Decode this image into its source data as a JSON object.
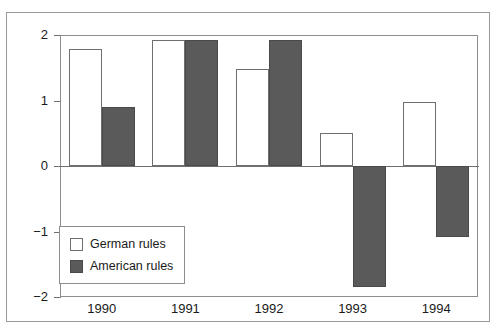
{
  "chart_data": {
    "type": "bar",
    "title": "",
    "subtitle": "",
    "xlabel": "",
    "ylabel": "",
    "categories": [
      "1990",
      "1991",
      "1992",
      "1993",
      "1994"
    ],
    "series": [
      {
        "name": "German rules",
        "values": [
          1.79,
          1.93,
          1.48,
          0.51,
          0.97
        ],
        "color": "#ffffff",
        "edge_color": "#6f6f6f"
      },
      {
        "name": "American rules",
        "values": [
          0.9,
          1.93,
          1.92,
          -1.85,
          -1.08
        ],
        "color": "#5a5a5a",
        "edge_color": "#4a4a4a"
      }
    ],
    "ylim": [
      -2,
      2
    ],
    "yticks": [
      2,
      1,
      0,
      -1,
      -2
    ],
    "ytick_labels": [
      "2",
      "1",
      "0",
      "−1",
      "−2"
    ],
    "grid": false,
    "zero_line": true,
    "legend_position": "lower-left-inside"
  },
  "axes": {
    "y_ticks": [
      {
        "label": "2",
        "value": 2
      },
      {
        "label": "1",
        "value": 1
      },
      {
        "label": "0",
        "value": 0
      },
      {
        "label": "−1",
        "value": -1
      },
      {
        "label": "−2",
        "value": -2
      }
    ],
    "x_ticks": [
      {
        "label": "1990"
      },
      {
        "label": "1991"
      },
      {
        "label": "1992"
      },
      {
        "label": "1993"
      },
      {
        "label": "1994"
      }
    ]
  },
  "legend": {
    "entries": [
      {
        "label": "German rules"
      },
      {
        "label": "American rules"
      }
    ]
  },
  "colors": {
    "german_fill": "#ffffff",
    "american_fill": "#5a5a5a",
    "axis": "#8d8d8d",
    "frame": "#9a9a9a",
    "text": "#1a1a1a"
  }
}
